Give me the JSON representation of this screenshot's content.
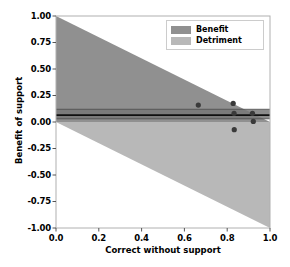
{
  "chart_data": {
    "type": "area",
    "title": "",
    "xlabel": "Correct without support",
    "ylabel": "Benefit of support",
    "xlim": [
      0.0,
      1.0
    ],
    "ylim": [
      -1.0,
      1.0
    ],
    "xticks": [
      "0.0",
      "0.2",
      "0.4",
      "0.6",
      "0.8",
      "1.0"
    ],
    "xtick_values": [
      0.0,
      0.2,
      0.4,
      0.6,
      0.8,
      1.0
    ],
    "yticks": [
      "1.00",
      "0.75",
      "0.50",
      "0.25",
      "0.00",
      "-0.25",
      "-0.50",
      "-0.75",
      "-1.00"
    ],
    "ytick_values": [
      1.0,
      0.75,
      0.5,
      0.25,
      0.0,
      -0.25,
      -0.5,
      -0.75,
      -1.0
    ],
    "grid": false,
    "legend_position": "upper right",
    "legend": [
      {
        "label": "Benefit",
        "color": "#909090"
      },
      {
        "label": "Detriment",
        "color": "#b8b8b8"
      }
    ],
    "regions": [
      {
        "name": "Benefit",
        "color": "#909090",
        "description": "Triangle from (0,0) to (0,1) to (1,0)",
        "polygon": [
          [
            0.0,
            0.0
          ],
          [
            0.0,
            1.0
          ],
          [
            1.0,
            0.0
          ]
        ]
      },
      {
        "name": "Detriment",
        "color": "#b8b8b8",
        "description": "Triangle from (0,0) to (1,-1) to (1,0)",
        "polygon": [
          [
            0.0,
            0.0
          ],
          [
            1.0,
            -1.0
          ],
          [
            1.0,
            0.0
          ]
        ]
      }
    ],
    "mean_line": {
      "name": "mean benefit",
      "y": 0.065,
      "color": "#101010"
    },
    "ci_band": {
      "name": "confidence interval",
      "y_low": 0.03,
      "y_high": 0.12,
      "color": "#787878"
    },
    "series": [
      {
        "name": "studies",
        "marker": "o",
        "color": "#3a3a3a",
        "points": [
          {
            "x": 0.665,
            "y": 0.16
          },
          {
            "x": 0.828,
            "y": 0.175
          },
          {
            "x": 0.832,
            "y": 0.082
          },
          {
            "x": 0.833,
            "y": -0.072
          },
          {
            "x": 0.918,
            "y": 0.082
          },
          {
            "x": 0.922,
            "y": 0.005
          }
        ]
      }
    ]
  }
}
